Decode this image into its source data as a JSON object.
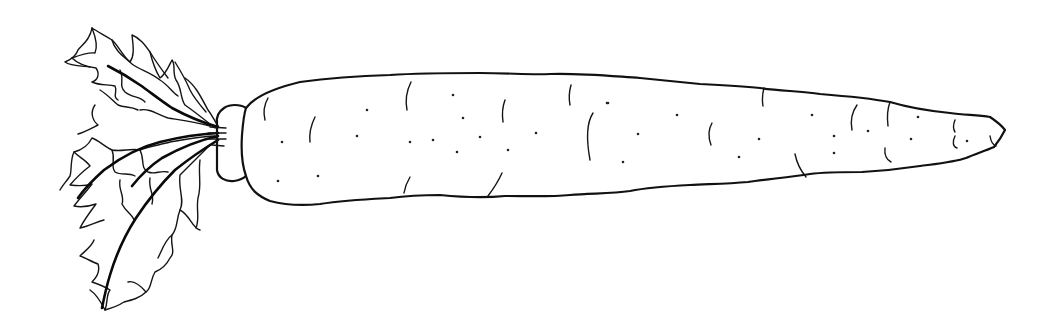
{
  "image": {
    "subject": "Line drawing of a carrot with leafy top",
    "style": "black ink outline on white background",
    "orientation": "horizontal, leaves on left, tapered tip on right",
    "colors": {
      "background": "#ffffff",
      "ink": "#111111"
    }
  }
}
